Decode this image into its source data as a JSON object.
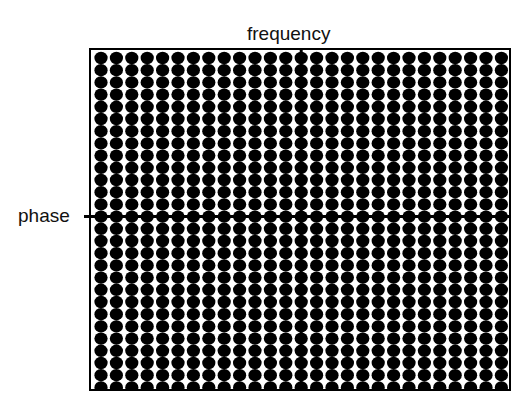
{
  "diagram": {
    "x_axis_label": "frequency",
    "y_axis_label": "phase",
    "grid": {
      "columns": 27,
      "rows": 28,
      "dot_color": "#000000",
      "background": "#ffffff",
      "box": {
        "left": 90,
        "top": 49,
        "right": 510,
        "bottom": 390
      },
      "first_dot_center": {
        "x": 101,
        "y": 58
      },
      "spacing": {
        "x": 15.4,
        "y": 12.2
      },
      "dot_radius": {
        "x": 6.6,
        "y": 6.2
      },
      "vertical_axis_column": 13,
      "horizontal_axis_row": 13
    }
  }
}
